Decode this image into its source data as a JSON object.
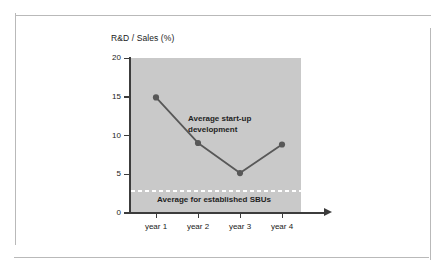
{
  "frame": {
    "border_color": "#b9b9b9"
  },
  "chart_data": {
    "type": "line",
    "title": "",
    "ylabel": "R&D / Sales (%)",
    "xlabel": "",
    "categories": [
      "year 1",
      "year 2",
      "year 3",
      "year 4"
    ],
    "series": [
      {
        "name": "Average start-up development",
        "values": [
          14.9,
          9.0,
          5.1,
          8.8
        ],
        "color": "#585858",
        "marker": "circle"
      }
    ],
    "ylim": [
      0,
      20
    ],
    "yticks": [
      0,
      5,
      10,
      15,
      20
    ],
    "ytick_labels": [
      "0",
      "5",
      "10",
      "15",
      "20"
    ],
    "grid": false,
    "legend": "none",
    "plot_background": "#c9c9c9",
    "annotations": [
      {
        "name": "series-label",
        "text": "Average start-up\ndevelopment"
      },
      {
        "name": "benchmark-label",
        "text": "Average for established SBUs"
      }
    ],
    "reference_line": {
      "label": "Average for established SBUs",
      "value": 3,
      "style": "dashed",
      "color": "#ffffff"
    }
  }
}
